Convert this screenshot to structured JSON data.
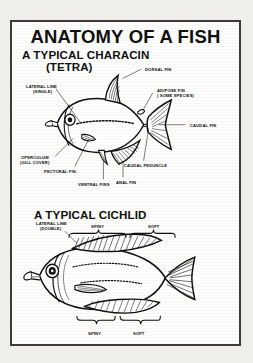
{
  "poster": {
    "title": "ANATOMY OF A FISH",
    "sections": [
      {
        "heading": "A TYPICAL CHARACIN",
        "subheading": "(TETRA)",
        "labels": [
          {
            "id": "dorsal-fin",
            "text": "DORSAL FIN"
          },
          {
            "id": "adipose-fin-1",
            "text": "ADIPOSE FIN"
          },
          {
            "id": "adipose-fin-2",
            "text": "( SOME SPECIES)"
          },
          {
            "id": "lateral-line-1",
            "text": "LATERAL LINE"
          },
          {
            "id": "lateral-line-2",
            "text": "(SINGLE)"
          },
          {
            "id": "caudal-fin",
            "text": "CAUDAL FIN"
          },
          {
            "id": "caudal-peduncle",
            "text": "CAUDAL PEDUNCLE"
          },
          {
            "id": "operculum-1",
            "text": "OPERCULUM"
          },
          {
            "id": "operculum-2",
            "text": "(GILL COVER)"
          },
          {
            "id": "pectoral-fin",
            "text": "PECTORAL FIN"
          },
          {
            "id": "ventral-fins",
            "text": "VENTRAL FINS"
          },
          {
            "id": "anal-fin",
            "text": "ANAL FIN"
          }
        ]
      },
      {
        "heading": "A TYPICAL CICHLID",
        "subheading": "",
        "labels": [
          {
            "id": "lateral-line-1",
            "text": "LATERAL LINE"
          },
          {
            "id": "lateral-line-2",
            "text": "(DOUBLE)"
          },
          {
            "id": "spiny-top",
            "text": "SPINY"
          },
          {
            "id": "soft-top",
            "text": "SOFT"
          },
          {
            "id": "spiny-bottom",
            "text": "SPINY"
          },
          {
            "id": "soft-bottom",
            "text": "SOFT"
          }
        ]
      }
    ],
    "colors": {
      "ink": "#111111",
      "paper": "#fdfdfb",
      "frame": "#3b3b3b",
      "page": "#efeeea"
    }
  }
}
